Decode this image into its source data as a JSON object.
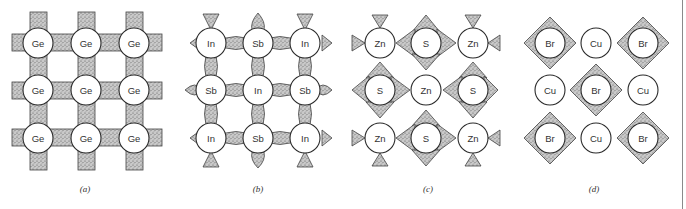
{
  "figure": {
    "panels": [
      {
        "id": "a",
        "label": "(a)",
        "structure": "covalent-diamond",
        "atoms": [
          [
            "Ge",
            "Ge",
            "Ge"
          ],
          [
            "Ge",
            "Ge",
            "Ge"
          ],
          [
            "Ge",
            "Ge",
            "Ge"
          ]
        ]
      },
      {
        "id": "b",
        "label": "(b)",
        "structure": "partially-ionic",
        "atoms": [
          [
            "In",
            "Sb",
            "In"
          ],
          [
            "Sb",
            "In",
            "Sb"
          ],
          [
            "In",
            "Sb",
            "In"
          ]
        ]
      },
      {
        "id": "c",
        "label": "(c)",
        "structure": "more-ionic",
        "atoms": [
          [
            "Zn",
            "S",
            "Zn"
          ],
          [
            "S",
            "Zn",
            "S"
          ],
          [
            "Zn",
            "S",
            "Zn"
          ]
        ]
      },
      {
        "id": "d",
        "label": "(d)",
        "structure": "ionic",
        "atoms": [
          [
            "Br",
            "Cu",
            "Br"
          ],
          [
            "Cu",
            "Br",
            "Cu"
          ],
          [
            "Br",
            "Cu",
            "Br"
          ]
        ]
      }
    ],
    "colors": {
      "stipple_fill": "#b8b8b8",
      "outline": "#2a2a2a",
      "background": "#ffffff"
    }
  }
}
